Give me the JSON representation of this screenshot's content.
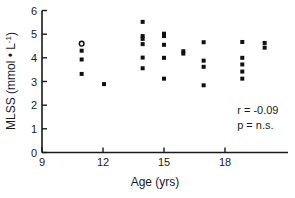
{
  "chart_data": {
    "type": "scatter",
    "title": "",
    "xlabel": "Age (yrs)",
    "ylabel": "MLSS (mmol • L⁻¹)",
    "ylabel_parts": {
      "main": "MLSS (mmol • L",
      "sup": "-1",
      "tail": ")"
    },
    "xlim": [
      9,
      21
    ],
    "ylim": [
      0,
      6
    ],
    "xticks": [
      9,
      12,
      15,
      18
    ],
    "xticklabels": [
      "9",
      "12",
      "15",
      "18"
    ],
    "yticks": [
      0,
      1,
      2,
      3,
      4,
      5,
      6
    ],
    "yticklabels": [
      "0",
      "1",
      "2",
      "3",
      "4",
      "5",
      "6"
    ],
    "grid": false,
    "legend": null,
    "marker": "filled-square",
    "marker_color": "#111111",
    "points": [
      {
        "x": 10.95,
        "y": 4.6,
        "open": true
      },
      {
        "x": 10.95,
        "y": 4.3,
        "open": false
      },
      {
        "x": 10.95,
        "y": 3.93,
        "open": false
      },
      {
        "x": 10.95,
        "y": 3.32,
        "open": false
      },
      {
        "x": 12.05,
        "y": 2.89,
        "open": false
      },
      {
        "x": 13.95,
        "y": 5.52,
        "open": false
      },
      {
        "x": 13.95,
        "y": 4.92,
        "open": false
      },
      {
        "x": 13.95,
        "y": 4.8,
        "open": false
      },
      {
        "x": 13.95,
        "y": 4.58,
        "open": false
      },
      {
        "x": 13.95,
        "y": 4.01,
        "open": false
      },
      {
        "x": 13.95,
        "y": 3.56,
        "open": false
      },
      {
        "x": 15.0,
        "y": 5.02,
        "open": false
      },
      {
        "x": 15.0,
        "y": 4.92,
        "open": false
      },
      {
        "x": 15.0,
        "y": 4.55,
        "open": false
      },
      {
        "x": 15.0,
        "y": 4.0,
        "open": false
      },
      {
        "x": 15.0,
        "y": 3.12,
        "open": false
      },
      {
        "x": 15.95,
        "y": 4.28,
        "open": false
      },
      {
        "x": 15.95,
        "y": 4.18,
        "open": false
      },
      {
        "x": 16.95,
        "y": 4.66,
        "open": false
      },
      {
        "x": 16.95,
        "y": 3.88,
        "open": false
      },
      {
        "x": 16.95,
        "y": 3.62,
        "open": false
      },
      {
        "x": 16.95,
        "y": 2.84,
        "open": false
      },
      {
        "x": 18.85,
        "y": 4.67,
        "open": false
      },
      {
        "x": 18.85,
        "y": 4.0,
        "open": false
      },
      {
        "x": 18.85,
        "y": 3.72,
        "open": false
      },
      {
        "x": 18.85,
        "y": 3.42,
        "open": false
      },
      {
        "x": 18.85,
        "y": 3.12,
        "open": false
      },
      {
        "x": 19.95,
        "y": 4.63,
        "open": false
      },
      {
        "x": 19.95,
        "y": 4.43,
        "open": false
      }
    ],
    "annotations": [
      {
        "text": "r = -0.09",
        "x": 18.6,
        "y": 1.62
      },
      {
        "text": "p = n.s.",
        "x": 18.6,
        "y": 1.0
      }
    ]
  }
}
